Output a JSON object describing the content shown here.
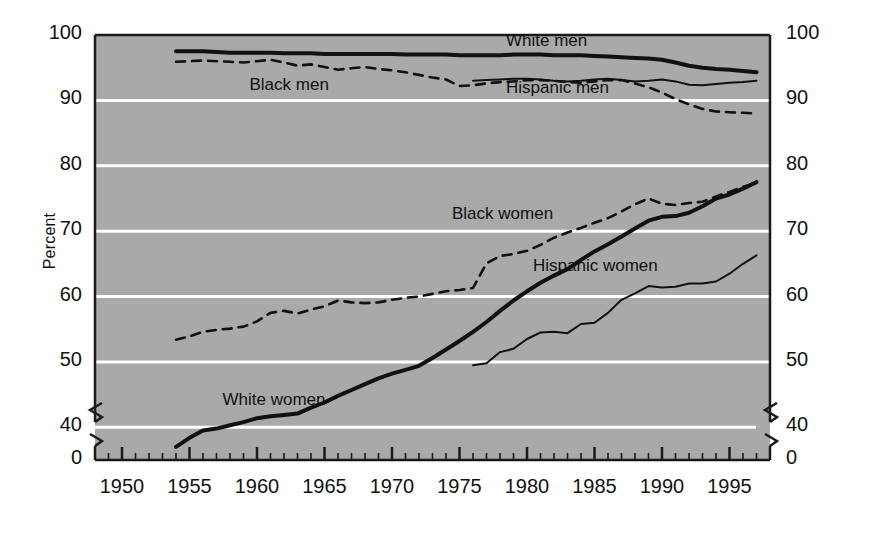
{
  "chart_data": {
    "type": "line",
    "title": "",
    "subtitle": "",
    "xlabel": "",
    "ylabel": "Percent",
    "xlim": [
      1948,
      1998
    ],
    "ylim": [
      35,
      100
    ],
    "axis_break_y": true,
    "axis_break_note": "y-axis broken between 0 and just under 40",
    "grid": "horizontal-white",
    "legend_position": "inline-labels",
    "y_ticks": [
      "100",
      "90",
      "80",
      "70",
      "60",
      "50",
      "40",
      "0"
    ],
    "y_ticks_right": [
      "100",
      "90",
      "80",
      "70",
      "60",
      "50",
      "40",
      "0"
    ],
    "x_ticks": [
      "1950",
      "1955",
      "1960",
      "1965",
      "1970",
      "1975",
      "1980",
      "1985",
      "1990",
      "1995"
    ],
    "minor_x_ticks_every": 1,
    "colors": {
      "plot_background": "#a9a9a9",
      "gridline": "#ffffff",
      "axis": "#1a1a1a",
      "line": "#111111",
      "page_background": "#ffffff"
    },
    "series": [
      {
        "name": "White men",
        "style": "solid-thick",
        "label_x": 1982,
        "label_y": 99,
        "x": [
          1954,
          1955,
          1956,
          1957,
          1958,
          1959,
          1960,
          1961,
          1962,
          1963,
          1964,
          1965,
          1966,
          1967,
          1968,
          1969,
          1970,
          1971,
          1972,
          1973,
          1974,
          1975,
          1976,
          1977,
          1978,
          1979,
          1980,
          1981,
          1982,
          1983,
          1984,
          1985,
          1986,
          1987,
          1988,
          1989,
          1990,
          1991,
          1992,
          1993,
          1994,
          1995,
          1996,
          1997
        ],
        "values": [
          97.5,
          97.5,
          97.5,
          97.4,
          97.3,
          97.3,
          97.3,
          97.3,
          97.2,
          97.2,
          97.2,
          97.1,
          97.1,
          97.1,
          97.1,
          97.1,
          97.1,
          97.0,
          97.0,
          97.0,
          97.0,
          96.9,
          96.9,
          96.9,
          96.9,
          97.0,
          97.0,
          97.0,
          96.9,
          96.9,
          96.9,
          96.8,
          96.7,
          96.6,
          96.5,
          96.4,
          96.2,
          95.8,
          95.3,
          95.0,
          94.8,
          94.7,
          94.5,
          94.3
        ]
      },
      {
        "name": "Black men",
        "style": "dashed",
        "label_x": 1963,
        "label_y": 92.2,
        "x": [
          1954,
          1955,
          1956,
          1957,
          1958,
          1959,
          1960,
          1961,
          1962,
          1963,
          1964,
          1965,
          1966,
          1967,
          1968,
          1969,
          1970,
          1971,
          1972,
          1973,
          1974,
          1975,
          1976,
          1977,
          1978,
          1979,
          1980,
          1981,
          1982,
          1983,
          1984,
          1985,
          1986,
          1987,
          1988,
          1989,
          1990,
          1991,
          1992,
          1993,
          1994,
          1995,
          1996,
          1997
        ],
        "values": [
          95.9,
          96.0,
          96.1,
          96.0,
          95.9,
          95.8,
          96.0,
          96.2,
          95.8,
          95.3,
          95.5,
          95.1,
          94.7,
          94.9,
          95.1,
          94.8,
          94.6,
          94.3,
          93.9,
          93.5,
          93.2,
          92.2,
          92.3,
          92.6,
          92.8,
          92.9,
          93.1,
          93.1,
          93.0,
          92.8,
          92.7,
          92.9,
          93.1,
          93.1,
          92.6,
          92.0,
          91.2,
          90.2,
          89.4,
          88.7,
          88.3,
          88.2,
          88.1,
          88.0
        ]
      },
      {
        "name": "Hispanic men",
        "style": "solid-thin",
        "label_x": 1982,
        "label_y": 91.8,
        "x": [
          1976,
          1977,
          1978,
          1979,
          1980,
          1981,
          1982,
          1983,
          1984,
          1985,
          1986,
          1987,
          1988,
          1989,
          1990,
          1991,
          1992,
          1993,
          1994,
          1995,
          1996,
          1997
        ],
        "values": [
          93.0,
          93.1,
          93.2,
          93.3,
          93.3,
          93.2,
          93.0,
          92.9,
          93.0,
          93.2,
          93.3,
          93.1,
          92.9,
          93.0,
          93.2,
          92.9,
          92.4,
          92.3,
          92.5,
          92.7,
          92.8,
          93.0
        ]
      },
      {
        "name": "White women",
        "style": "solid-thick",
        "label_x": 1961,
        "label_y": 44,
        "x": [
          1954,
          1955,
          1956,
          1957,
          1958,
          1959,
          1960,
          1961,
          1962,
          1963,
          1964,
          1965,
          1966,
          1967,
          1968,
          1969,
          1970,
          1971,
          1972,
          1973,
          1974,
          1975,
          1976,
          1977,
          1978,
          1979,
          1980,
          1981,
          1982,
          1983,
          1984,
          1985,
          1986,
          1987,
          1988,
          1989,
          1990,
          1991,
          1992,
          1993,
          1994,
          1995,
          1996,
          1997
        ],
        "values": [
          37.0,
          38.4,
          39.5,
          39.8,
          40.3,
          40.8,
          41.4,
          41.7,
          41.9,
          42.1,
          43.0,
          43.8,
          44.8,
          45.7,
          46.6,
          47.5,
          48.2,
          48.8,
          49.4,
          50.6,
          51.9,
          53.2,
          54.6,
          56.1,
          57.8,
          59.4,
          60.8,
          62.1,
          63.2,
          64.2,
          65.6,
          66.9,
          68.0,
          69.2,
          70.4,
          71.6,
          72.2,
          72.3,
          72.8,
          73.8,
          75.0,
          75.6,
          76.5,
          77.5
        ]
      },
      {
        "name": "Black women",
        "style": "dashed",
        "label_x": 1978,
        "label_y": 72.5,
        "x": [
          1954,
          1955,
          1956,
          1957,
          1958,
          1959,
          1960,
          1961,
          1962,
          1963,
          1964,
          1965,
          1966,
          1967,
          1968,
          1969,
          1970,
          1971,
          1972,
          1973,
          1974,
          1975,
          1976,
          1977,
          1978,
          1979,
          1980,
          1981,
          1982,
          1983,
          1984,
          1985,
          1986,
          1987,
          1988,
          1989,
          1990,
          1991,
          1992,
          1993,
          1994,
          1995,
          1996,
          1997
        ],
        "values": [
          53.4,
          53.9,
          54.6,
          54.9,
          55.1,
          55.4,
          56.2,
          57.5,
          57.8,
          57.4,
          58.0,
          58.5,
          59.4,
          59.1,
          59.0,
          59.1,
          59.5,
          59.8,
          60.0,
          60.4,
          60.8,
          61.0,
          61.3,
          65.1,
          66.2,
          66.5,
          67.0,
          67.9,
          69.0,
          69.8,
          70.5,
          71.3,
          72.0,
          73.0,
          74.1,
          75.0,
          74.2,
          74.0,
          74.3,
          74.5,
          75.3,
          76.0,
          76.8,
          77.4
        ]
      },
      {
        "name": "Hispanic women",
        "style": "solid-thin",
        "label_x": 1984,
        "label_y": 64.5,
        "x": [
          1976,
          1977,
          1978,
          1979,
          1980,
          1981,
          1982,
          1983,
          1984,
          1985,
          1986,
          1987,
          1988,
          1989,
          1990,
          1991,
          1992,
          1993,
          1994,
          1995,
          1996,
          1997
        ],
        "values": [
          49.5,
          49.8,
          51.5,
          52.0,
          53.5,
          54.5,
          54.6,
          54.4,
          55.8,
          56.0,
          57.5,
          59.5,
          60.5,
          61.6,
          61.4,
          61.5,
          62.0,
          62.0,
          62.3,
          63.5,
          65.0,
          66.3
        ]
      }
    ]
  },
  "axis": {
    "y_title": "Percent"
  }
}
